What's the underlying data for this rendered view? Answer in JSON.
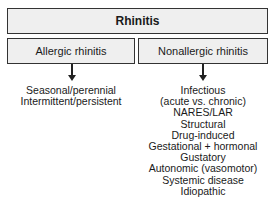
{
  "diagram": {
    "root": "Rhinitis",
    "branches": [
      {
        "label": "Allergic rhinitis",
        "items": [
          "Seasonal/perennial",
          "Intermittent/persistent"
        ]
      },
      {
        "label": "Nonallergic rhinitis",
        "items": [
          "Infectious",
          "(acute vs. chronic)",
          "NARES/LAR",
          "Structural",
          "Drug-induced",
          "Gestational + hormonal",
          "Gustatory",
          "Autonomic (vasomotor)",
          "Systemic disease",
          "Idiopathic"
        ]
      }
    ]
  }
}
